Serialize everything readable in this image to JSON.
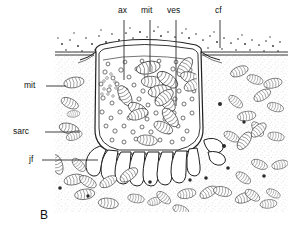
{
  "figure": {
    "panel_letter": "B",
    "style": "line-drawing",
    "background_color": "#ffffff",
    "ink_color": "#1a1a1a",
    "stipple_color": "#8c8c8c"
  },
  "labels": {
    "top": [
      {
        "key": "ax",
        "text": "ax",
        "x": 118,
        "y": 10,
        "leader": {
          "x1": 124,
          "y1": 20,
          "x2": 124,
          "y2": 80
        }
      },
      {
        "key": "mit",
        "text": "mit",
        "x": 142,
        "y": 10,
        "leader": {
          "x1": 150,
          "y1": 20,
          "x2": 150,
          "y2": 72
        }
      },
      {
        "key": "ves",
        "text": "ves",
        "x": 168,
        "y": 10,
        "leader": {
          "x1": 176,
          "y1": 20,
          "x2": 176,
          "y2": 106
        }
      },
      {
        "key": "cf",
        "text": "cf",
        "x": 215,
        "y": 10,
        "leader": {
          "x1": 220,
          "y1": 20,
          "x2": 220,
          "y2": 48
        }
      }
    ],
    "left": [
      {
        "key": "mit",
        "text": "mit",
        "x": 24,
        "y": 82,
        "leader": {
          "x1": 46,
          "y1": 86,
          "x2": 66,
          "y2": 86
        }
      },
      {
        "key": "sarc",
        "text": "sarc",
        "x": 14,
        "y": 128,
        "leader": {
          "x1": 45,
          "y1": 132,
          "x2": 80,
          "y2": 132
        }
      },
      {
        "key": "jf",
        "text": "jf",
        "x": 28,
        "y": 156,
        "leader": {
          "x1": 42,
          "y1": 160,
          "x2": 98,
          "y2": 160
        }
      }
    ]
  },
  "legend_meanings": {
    "ax": "axon terminal",
    "mit": "mitochondrion",
    "ves": "synaptic vesicles",
    "cf": "collagen fibrils",
    "sarc": "sarcoplasm",
    "jf": "junctional folds"
  }
}
